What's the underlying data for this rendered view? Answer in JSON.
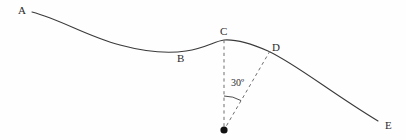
{
  "figure": {
    "width": 406,
    "height": 140,
    "background_color": "#fefefe",
    "stroke_color": "#3a3a3a",
    "dash_color": "#6e6e6e",
    "vertex_color": "#111111",
    "label_color": "#2b2b2b"
  },
  "points": [
    {
      "id": "A",
      "label": "A",
      "x": 32,
      "y": 12,
      "label_x": 18,
      "label_y": 5
    },
    {
      "id": "B",
      "label": "B",
      "x": 180,
      "y": 52,
      "label_x": 177,
      "label_y": 53
    },
    {
      "id": "C",
      "label": "C",
      "x": 224,
      "y": 40,
      "label_x": 220,
      "label_y": 26
    },
    {
      "id": "D",
      "label": "D",
      "x": 270,
      "y": 51,
      "label_x": 272,
      "label_y": 42
    },
    {
      "id": "E",
      "label": "E",
      "x": 378,
      "y": 121,
      "label_x": 385,
      "label_y": 120
    }
  ],
  "vertex": {
    "name": "origin-dot",
    "x": 224,
    "y": 130,
    "radius": 3.6
  },
  "angle": {
    "value_label": "30º",
    "degrees": 30,
    "label_x": 231,
    "label_y": 78,
    "arc_radius": 34
  },
  "curve": {
    "description": "wave-like curve descending from A, trough near B, crest at C, then falling through D to E",
    "path": "M 32 12 C 62 20, 86 36, 120 45 C 146 52, 166 54, 186 51 C 206 48, 215 41, 224 40 C 238 39, 252 44, 268 51 C 296 64, 330 92, 378 121"
  },
  "dashed_lines": [
    {
      "name": "vertical-dashed-line",
      "from": "C",
      "to": "vertex",
      "x1": 224,
      "y1": 40,
      "x2": 224,
      "y2": 130
    },
    {
      "name": "slanted-dashed-line",
      "from": "D",
      "to": "vertex",
      "x1": 270,
      "y1": 51,
      "x2": 224,
      "y2": 130
    }
  ]
}
